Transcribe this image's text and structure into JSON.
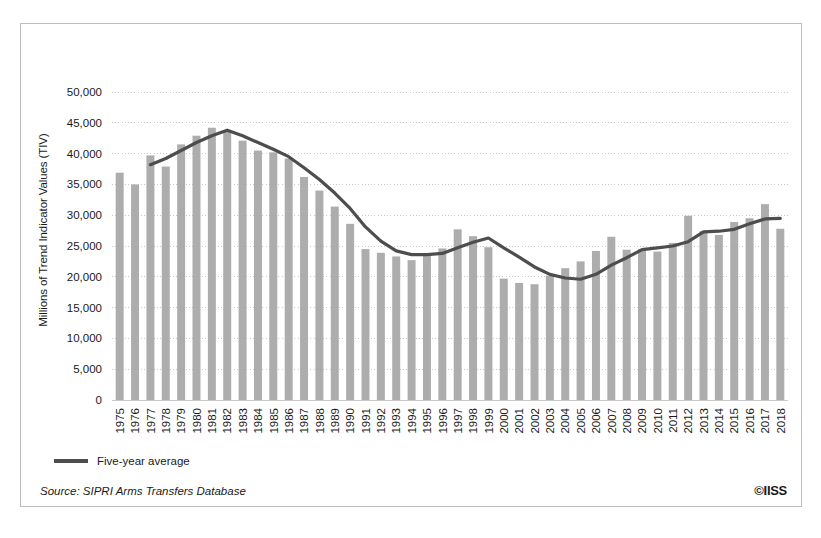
{
  "chart_data": {
    "type": "bar",
    "title": "",
    "xlabel": "",
    "ylabel": "Millions of Trend Indicator Values (TIV)",
    "ylim": [
      0,
      50000
    ],
    "ytick_labels": [
      "0",
      "5,000",
      "10,000",
      "15,000",
      "20,000",
      "25,000",
      "30,000",
      "35,000",
      "40,000",
      "45,000",
      "50,000"
    ],
    "ytick_values": [
      0,
      5000,
      10000,
      15000,
      20000,
      25000,
      30000,
      35000,
      40000,
      45000,
      50000
    ],
    "grid": true,
    "grid_axis": "y",
    "grid_style": "dotted",
    "legend_position": "below-plot-left",
    "categories": [
      "1975",
      "1976",
      "1977",
      "1978",
      "1979",
      "1980",
      "1981",
      "1982",
      "1983",
      "1984",
      "1985",
      "1986",
      "1987",
      "1988",
      "1989",
      "1990",
      "1991",
      "1992",
      "1993",
      "1994",
      "1995",
      "1996",
      "1997",
      "1998",
      "1999",
      "2000",
      "2001",
      "2002",
      "2003",
      "2004",
      "2005",
      "2006",
      "2007",
      "2008",
      "2009",
      "2010",
      "2011",
      "2012",
      "2013",
      "2014",
      "2015",
      "2016",
      "2017",
      "2018"
    ],
    "series": [
      {
        "name": "Arms transfers",
        "type": "bar",
        "color": "#a9a9a9",
        "values": [
          36900,
          35000,
          39700,
          37900,
          41500,
          42900,
          44200,
          43600,
          42100,
          40500,
          40200,
          39200,
          36200,
          34000,
          31400,
          28600,
          24500,
          23900,
          23300,
          22700,
          23700,
          24600,
          27700,
          26600,
          24800,
          19700,
          19000,
          18800,
          20200,
          21400,
          22500,
          24200,
          26500,
          24400,
          24500,
          24100,
          25500,
          29900,
          27400,
          26800,
          28900,
          29500,
          31800,
          27800
        ]
      },
      {
        "name": "Five-year average",
        "type": "line",
        "color": "#4d4d4d",
        "values": [
          null,
          null,
          38200,
          39200,
          40500,
          41800,
          42900,
          43800,
          42900,
          41800,
          40700,
          39500,
          37700,
          35800,
          33600,
          31100,
          28100,
          25800,
          24200,
          23600,
          23600,
          23800,
          24700,
          25600,
          26300,
          24700,
          23200,
          21600,
          20400,
          19800,
          19600,
          20400,
          21900,
          23100,
          24400,
          24700,
          25000,
          25700,
          27300,
          27400,
          27700,
          28600,
          29400,
          29500
        ]
      }
    ]
  },
  "legend": {
    "line_label": "Five-year average"
  },
  "footer": {
    "source": "Source: SIPRI Arms Transfers Database",
    "copyright": "©IISS"
  }
}
